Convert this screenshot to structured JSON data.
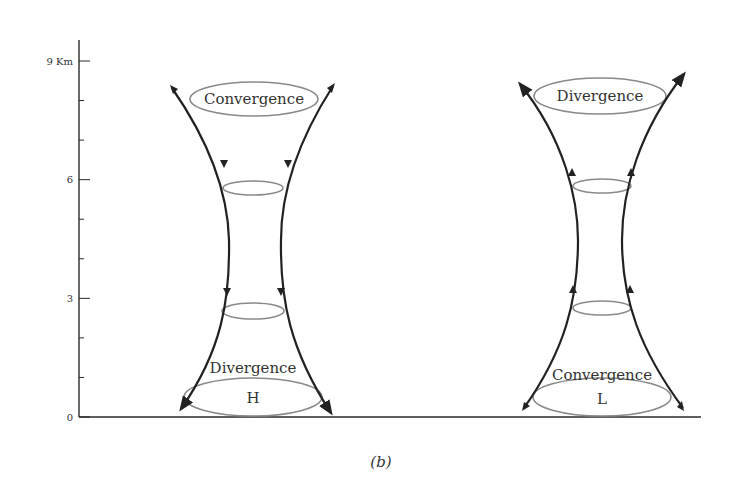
{
  "axis": {
    "unit": "Km",
    "major_ticks": [
      {
        "value": 0,
        "label": "0"
      },
      {
        "value": 3,
        "label": "3"
      },
      {
        "value": 6,
        "label": "6"
      },
      {
        "value": 9,
        "label": "9 Km"
      }
    ],
    "minor_tick_values": [
      1,
      2,
      4,
      5,
      7,
      8
    ],
    "range": [
      0,
      9
    ]
  },
  "systems": [
    {
      "name": "high-pressure",
      "center_label": "H",
      "top_label": "Convergence",
      "bottom_label": "Divergence",
      "flow_direction": "down"
    },
    {
      "name": "low-pressure",
      "center_label": "L",
      "top_label": "Divergence",
      "bottom_label": "Convergence",
      "flow_direction": "up"
    }
  ],
  "caption": "(b)"
}
